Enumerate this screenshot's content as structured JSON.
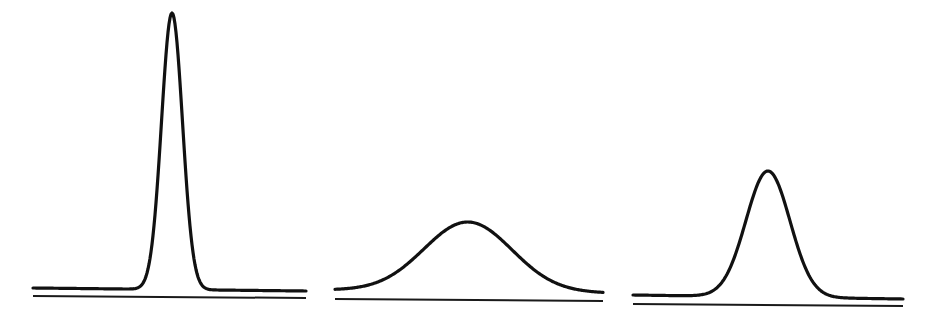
{
  "figure": {
    "colors": {
      "background": "#ffffff",
      "line": "#111111"
    }
  },
  "panels": [
    {
      "name": "narrow-tall-peak",
      "x_start": 33,
      "x_end": 306,
      "center_x": 172,
      "sigma": 10.5,
      "baseline_left_y": 288,
      "baseline_right_y": 291,
      "peak_y": 13,
      "axis_left_y": 296,
      "axis_right_y": 298
    },
    {
      "name": "broad-low-peak",
      "x_start": 335,
      "x_end": 603,
      "center_x": 468,
      "sigma": 44,
      "baseline_left_y": 290,
      "baseline_right_y": 293,
      "peak_y": 222,
      "axis_left_y": 299,
      "axis_right_y": 301
    },
    {
      "name": "medium-peak",
      "x_start": 633,
      "x_end": 903,
      "center_x": 768,
      "sigma": 22,
      "baseline_left_y": 295,
      "baseline_right_y": 299,
      "peak_y": 171,
      "axis_left_y": 304,
      "axis_right_y": 306
    }
  ]
}
